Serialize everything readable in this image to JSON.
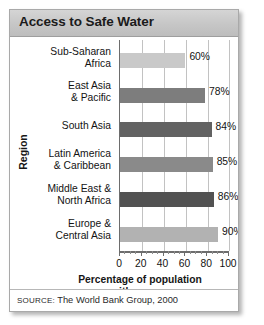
{
  "card": {
    "title": "Access to Safe Water",
    "source_prefix": "SOURCE:",
    "source_text": " The World Bank Group, 2000"
  },
  "chart_data": {
    "type": "bar",
    "orientation": "horizontal",
    "title": "Access to Safe Water",
    "xlabel": "Percentage of population\nwith access",
    "ylabel": "Region",
    "xlim": [
      0,
      100
    ],
    "xticks": [
      0,
      20,
      40,
      60,
      80,
      100
    ],
    "xtick_labels": [
      "0",
      "20",
      "40",
      "60",
      "80",
      "100"
    ],
    "minor_tick_step": 5,
    "grid": "vertical",
    "legend": "none",
    "categories": [
      "Sub-Saharan\nAfrica",
      "East Asia\n& Pacific",
      "South Asia",
      "Latin America\n& Caribbean",
      "Middle East &\nNorth Africa",
      "Europe &\nCentral Asia"
    ],
    "values": [
      60,
      78,
      84,
      85,
      86,
      90
    ],
    "value_labels": [
      "60%",
      "78%",
      "84%",
      "85%",
      "86%",
      "90%"
    ],
    "bar_colors": [
      "#c9c9c9",
      "#7d7d7d",
      "#626262",
      "#8a8a8a",
      "#525252",
      "#b2b2b2"
    ],
    "source": "SOURCE: The World Bank Group, 2000"
  },
  "colors": {
    "title_bar": "#c6c6c6",
    "card_border": "#a9a9a9",
    "axis": "#6d6d6d",
    "gridline": "#c2c2c2",
    "text": "#121212"
  }
}
